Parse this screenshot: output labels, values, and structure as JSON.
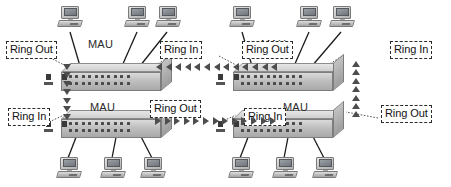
{
  "diagram": {
    "device_label": "MAU",
    "ring_in_label": "Ring In",
    "ring_out_label": "Ring Out",
    "colors": {
      "arrow": "#4d4d4d",
      "label_border": "#2b2b2b",
      "label_text": "#111111",
      "chassis_light": "#dadada",
      "chassis_dark": "#a9a9a9",
      "background": "#ffffff"
    },
    "units": [
      {
        "id": "mau-top-left",
        "name": "MAU",
        "position": "top-left",
        "left_port": "Ring Out",
        "right_port": "Ring In",
        "workstations": 3
      },
      {
        "id": "mau-top-right",
        "name": "MAU",
        "position": "top-right",
        "left_port": "Ring Out",
        "right_port": "Ring In",
        "workstations": 3
      },
      {
        "id": "mau-bottom-left",
        "name": "MAU",
        "position": "bottom-left",
        "left_port": "Ring In",
        "right_port": "Ring Out",
        "workstations": 3
      },
      {
        "id": "mau-bottom-right",
        "name": "MAU",
        "position": "bottom-right",
        "left_port": "Ring In",
        "right_port": "Ring Out",
        "workstations": 3
      }
    ],
    "links": [
      {
        "id": "link-top",
        "from": "mau-top-right",
        "to": "mau-top-left",
        "direction": "left",
        "arrow_count": 13
      },
      {
        "id": "link-bottom",
        "from": "mau-bottom-left",
        "to": "mau-bottom-right",
        "direction": "right",
        "arrow_count": 13
      },
      {
        "id": "link-left",
        "from": "mau-top-left",
        "to": "mau-bottom-left",
        "direction": "down",
        "arrow_count": 7
      },
      {
        "id": "link-right",
        "from": "mau-bottom-right",
        "to": "mau-top-right",
        "direction": "up",
        "arrow_count": 7
      }
    ]
  }
}
